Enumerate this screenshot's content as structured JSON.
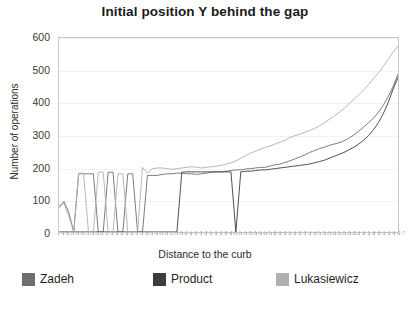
{
  "chart_data": {
    "type": "line",
    "title": "Initial position Y behind the gap",
    "xlabel": "Distance to the curb",
    "ylabel": "Number of operations",
    "ylim": [
      0,
      600
    ],
    "yticks": [
      0,
      100,
      200,
      300,
      400,
      500,
      600
    ],
    "grid": true,
    "legend_position": "bottom",
    "x": [
      1,
      2,
      3,
      4,
      5,
      6,
      7,
      8,
      9,
      10,
      11,
      12,
      13,
      14,
      15,
      16,
      17,
      18,
      19,
      20,
      21,
      22,
      23,
      24,
      25,
      26,
      27,
      28,
      29,
      30,
      31,
      32,
      33,
      34,
      35,
      36,
      37,
      38,
      39,
      40,
      41,
      42,
      43,
      44,
      45,
      46,
      47,
      48,
      49,
      50,
      51,
      52,
      53,
      54,
      55,
      56,
      57,
      58,
      59,
      60,
      61,
      62,
      63,
      64,
      65,
      66,
      67,
      68,
      69,
      70
    ],
    "series": [
      {
        "name": "Zadeh",
        "color": "#6e6e6e",
        "values": [
          75,
          95,
          60,
          0,
          180,
          180,
          180,
          180,
          0,
          0,
          185,
          185,
          0,
          0,
          180,
          180,
          0,
          0,
          175,
          175,
          175,
          178,
          180,
          180,
          182,
          182,
          180,
          180,
          178,
          180,
          182,
          185,
          186,
          186,
          188,
          190,
          192,
          192,
          195,
          196,
          198,
          200,
          200,
          204,
          208,
          210,
          215,
          220,
          226,
          232,
          238,
          246,
          252,
          258,
          262,
          268,
          272,
          276,
          282,
          290,
          300,
          312,
          324,
          338,
          352,
          370,
          392,
          418,
          450,
          488
        ]
      },
      {
        "name": "Product",
        "color": "#3d3d3d",
        "values": [
          0,
          0,
          0,
          0,
          0,
          0,
          0,
          0,
          0,
          0,
          0,
          0,
          0,
          0,
          0,
          0,
          0,
          0,
          0,
          0,
          0,
          0,
          0,
          0,
          0,
          185,
          186,
          186,
          186,
          186,
          186,
          186,
          186,
          186,
          186,
          186,
          0,
          186,
          188,
          188,
          190,
          192,
          192,
          194,
          196,
          198,
          200,
          202,
          204,
          206,
          208,
          210,
          214,
          218,
          222,
          228,
          234,
          240,
          246,
          254,
          262,
          272,
          284,
          298,
          316,
          338,
          366,
          400,
          442,
          478
        ]
      },
      {
        "name": "Lukasiewicz",
        "color": "#b0b0b0",
        "values": [
          82,
          88,
          50,
          0,
          182,
          182,
          0,
          0,
          185,
          185,
          0,
          0,
          180,
          180,
          0,
          0,
          0,
          200,
          182,
          196,
          198,
          198,
          196,
          194,
          196,
          198,
          200,
          202,
          200,
          198,
          200,
          202,
          204,
          206,
          210,
          214,
          220,
          228,
          236,
          244,
          250,
          256,
          262,
          266,
          272,
          278,
          284,
          292,
          298,
          302,
          308,
          314,
          320,
          328,
          338,
          348,
          358,
          370,
          382,
          396,
          410,
          424,
          440,
          456,
          474,
          492,
          512,
          534,
          556,
          575
        ]
      }
    ]
  },
  "legend": {
    "items": [
      {
        "label": "Zadeh",
        "color": "#6e6e6e"
      },
      {
        "label": "Product",
        "color": "#3d3d3d"
      },
      {
        "label": "Lukasiewicz",
        "color": "#b0b0b0"
      }
    ]
  },
  "x_tick_labels": [
    "0.5",
    "0.6",
    "0.7",
    "0.8",
    "0.9",
    "1.0",
    "1.1",
    "1.2",
    "1.3",
    "1.4",
    "1.5",
    "1.6",
    "1.7",
    "1.8",
    "1.9",
    "2.0",
    "2.1",
    "2.2",
    "2.3",
    "2.4",
    "2.5",
    "2.6",
    "2.7",
    "2.8",
    "2.9",
    "3.0",
    "3.1",
    "3.2",
    "3.3",
    "3.4",
    "3.5",
    "3.6",
    "3.7",
    "3.8",
    "3.9",
    "4.0",
    "4.1",
    "4.2",
    "4.3",
    "4.4",
    "4.5",
    "4.6",
    "4.7",
    "4.8",
    "4.9",
    "5.0",
    "5.1",
    "5.2",
    "5.3",
    "5.4",
    "5.5",
    "5.6",
    "5.7",
    "5.8",
    "5.9",
    "6.0",
    "6.1",
    "6.2",
    "6.3",
    "6.4",
    "6.5",
    "6.6",
    "6.7",
    "6.8",
    "6.9",
    "7.0",
    "7.1",
    "7.2",
    "7.3",
    "7.4"
  ]
}
